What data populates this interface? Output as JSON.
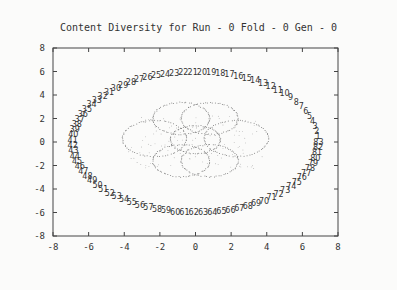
{
  "chart_data": {
    "type": "scatter",
    "title": "Content Diversity for Run - 0 Fold - 0 Gen - 0",
    "xlabel": "",
    "ylabel": "",
    "xlim": [
      -8,
      8
    ],
    "ylim": [
      -8,
      8
    ],
    "xticks": [
      -8,
      -6,
      -4,
      -2,
      0,
      2,
      4,
      6,
      8
    ],
    "yticks": [
      -8,
      -6,
      -4,
      -2,
      0,
      2,
      4,
      6,
      8
    ],
    "grid": false,
    "legend": null,
    "series": [
      {
        "name": "labeled-points",
        "description": "Points labeled 1-83 arranged counterclockwise on an ellipse (semi-axes ~6.9 x ~6.0) centered at origin, starting at right near (6.8, 0.5)",
        "labels_start": 1,
        "labels_end": 83,
        "ellipse": {
          "cx": 0,
          "cy": 0,
          "rx": 6.9,
          "ry": 6.0
        }
      },
      {
        "name": "inner-cluster",
        "description": "Dense dotted overlapping circles forming a diamond-shaped cluster spanning x -4..4, y -3..3",
        "circles": [
          {
            "cx": -2.3,
            "cy": 0.3,
            "r": 1.8
          },
          {
            "cx": 2.3,
            "cy": 0.3,
            "r": 1.8
          },
          {
            "cx": -0.8,
            "cy": 2.0,
            "r": 1.6
          },
          {
            "cx": 0.8,
            "cy": 2.0,
            "r": 1.6
          },
          {
            "cx": -0.8,
            "cy": -1.6,
            "r": 1.6
          },
          {
            "cx": 0.8,
            "cy": -1.6,
            "r": 1.6
          },
          {
            "cx": 0,
            "cy": 0.2,
            "r": 1.4
          }
        ]
      }
    ]
  }
}
